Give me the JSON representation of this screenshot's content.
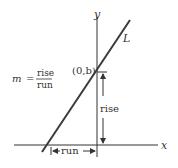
{
  "diagram": {
    "colors": {
      "line": "#3a3a3a",
      "axis": "#333333",
      "text": "#333333",
      "background": "#ffffff"
    },
    "axes": {
      "x_label": "x",
      "y_label": "y"
    },
    "line": {
      "label": "L"
    },
    "intercept_point": {
      "label": "(0,b)"
    },
    "formula": {
      "variable": "m",
      "equals": "=",
      "numerator": "rise",
      "denominator": "run"
    },
    "annotations": {
      "rise_label": "rise",
      "run_label": "run"
    }
  }
}
